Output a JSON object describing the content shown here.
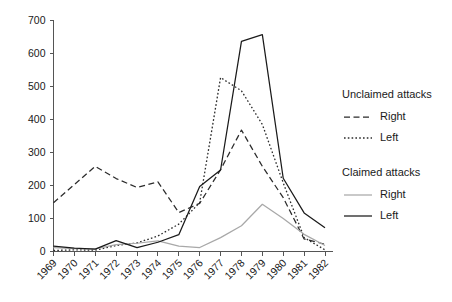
{
  "chart_data": {
    "type": "line",
    "title": "",
    "xlabel": "",
    "ylabel": "",
    "xlim": [
      1969,
      1982
    ],
    "ylim": [
      0,
      700
    ],
    "ytick_values": [
      0,
      100,
      200,
      300,
      400,
      500,
      600,
      700
    ],
    "ytick_labels": [
      "0",
      "100",
      "200",
      "300",
      "400",
      "500",
      "600",
      "700"
    ],
    "grid": false,
    "legend_position": "right",
    "categories": [
      1969,
      1970,
      1971,
      1972,
      1973,
      1974,
      1975,
      1976,
      1977,
      1978,
      1979,
      1980,
      1981,
      1982
    ],
    "xtick_labels": [
      "1969",
      "1970",
      "1971",
      "1972",
      "1973",
      "1974",
      "1975",
      "1976",
      "1977",
      "1978",
      "1979",
      "1980",
      "1981",
      "1982"
    ],
    "series": [
      {
        "name": "Unclaimed attacks - Right",
        "group": "Unclaimed attacks",
        "side": "Right",
        "style": "dashed",
        "color": "#2b2b2b",
        "values": [
          148,
          203,
          258,
          221,
          194,
          211,
          118,
          146,
          248,
          368,
          258,
          163,
          38,
          22
        ]
      },
      {
        "name": "Unclaimed attacks - Left",
        "group": "Unclaimed attacks",
        "side": "Left",
        "style": "dotted",
        "color": "#2b2b2b",
        "values": [
          3,
          5,
          4,
          18,
          26,
          47,
          83,
          148,
          527,
          487,
          385,
          208,
          42,
          5
        ]
      },
      {
        "name": "Claimed attacks - Right",
        "group": "Claimed attacks",
        "side": "Right",
        "style": "solid",
        "color": "#a8a8a8",
        "values": [
          12,
          9,
          8,
          21,
          25,
          32,
          16,
          12,
          42,
          78,
          143,
          100,
          52,
          18
        ]
      },
      {
        "name": "Claimed attacks - Left",
        "group": "Claimed attacks",
        "side": "Left",
        "style": "solid",
        "color": "#1a1a1a",
        "values": [
          16,
          10,
          7,
          33,
          12,
          28,
          51,
          197,
          247,
          637,
          657,
          222,
          117,
          72
        ]
      }
    ]
  },
  "legend": {
    "groups": [
      {
        "title": "Unclaimed attacks",
        "entries": [
          {
            "label": "Right",
            "style": "dashed",
            "color": "#2b2b2b"
          },
          {
            "label": "Left",
            "style": "dotted",
            "color": "#2b2b2b"
          }
        ]
      },
      {
        "title": "Claimed attacks",
        "entries": [
          {
            "label": "Right",
            "style": "solid",
            "color": "#a8a8a8"
          },
          {
            "label": "Left",
            "style": "solid",
            "color": "#1a1a1a"
          }
        ]
      }
    ]
  },
  "colors": {
    "axis": "#555555",
    "text": "#1a1a1a",
    "background": "#ffffff"
  }
}
